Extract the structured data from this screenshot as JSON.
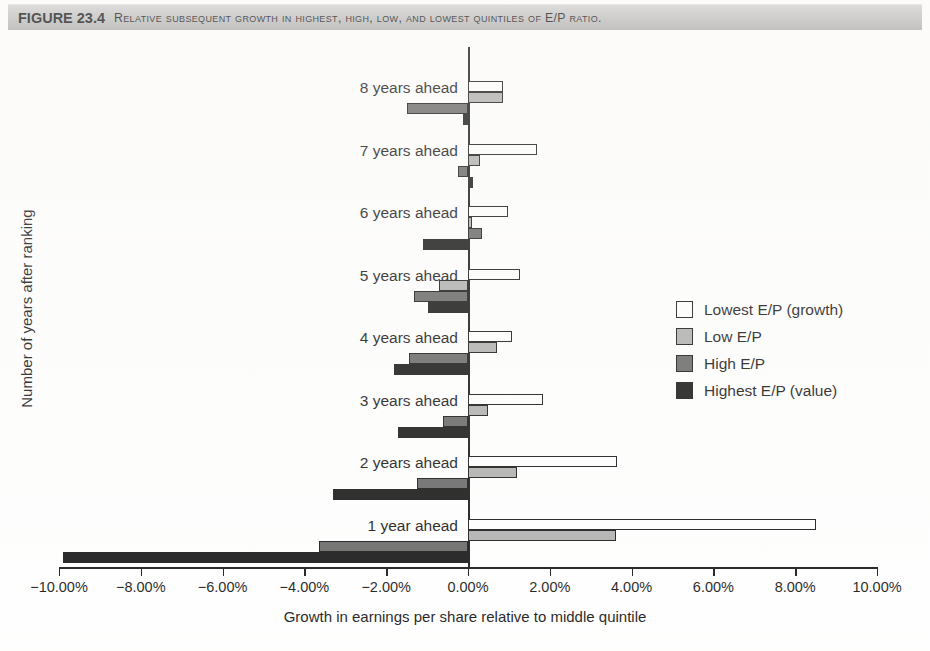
{
  "figure": {
    "number": "FIGURE 23.4",
    "caption": "Relative subsequent growth in highest, high, low, and lowest quintiles of E/P ratio."
  },
  "chart_data": {
    "type": "bar",
    "orientation": "horizontal",
    "title": "Relative subsequent growth in highest, high, low, and lowest quintiles of E/P ratio.",
    "xlabel": "Growth in earnings per share relative to middle quintile",
    "ylabel": "Number of years after ranking",
    "categories": [
      "1 year ahead",
      "2 years ahead",
      "3 years ahead",
      "4 years ahead",
      "5 years ahead",
      "6 years ahead",
      "7 years ahead",
      "8 years ahead"
    ],
    "series": [
      {
        "name": "Lowest E/P (growth)",
        "color": "#ffffff",
        "values": [
          8.5,
          3.64,
          1.83,
          1.08,
          1.27,
          0.98,
          1.68,
          0.85
        ]
      },
      {
        "name": "Low E/P",
        "color": "#a9a9a9",
        "values": [
          3.62,
          1.2,
          0.5,
          0.7,
          -0.72,
          0.1,
          0.3,
          0.85
        ]
      },
      {
        "name": "High E/P",
        "color": "#5a5a5a",
        "values": [
          -3.65,
          -1.25,
          -0.62,
          -1.45,
          -1.33,
          0.35,
          -0.25,
          -1.5
        ]
      },
      {
        "name": "Highest E/P (value)",
        "color": "#000000",
        "values": [
          -9.9,
          -3.3,
          -1.7,
          -1.82,
          -0.97,
          -1.1,
          0.12,
          -0.12
        ]
      }
    ],
    "xlim": [
      -10,
      10
    ],
    "xticks": [
      -10,
      -8,
      -6,
      -4,
      -2,
      0,
      2,
      4,
      6,
      8,
      10
    ],
    "xtick_labels": [
      "−10.00%",
      "−8.00%",
      "−6.00%",
      "−4.00%",
      "−2.00%",
      "0.00%",
      "2.00%",
      "4.00%",
      "6.00%",
      "8.00%",
      "10.00%"
    ],
    "grid": false,
    "legend_position": "middle-right",
    "legend_entries": [
      "Lowest E/P (growth)",
      "Low E/P",
      "High E/P",
      "Highest E/P (value)"
    ]
  }
}
